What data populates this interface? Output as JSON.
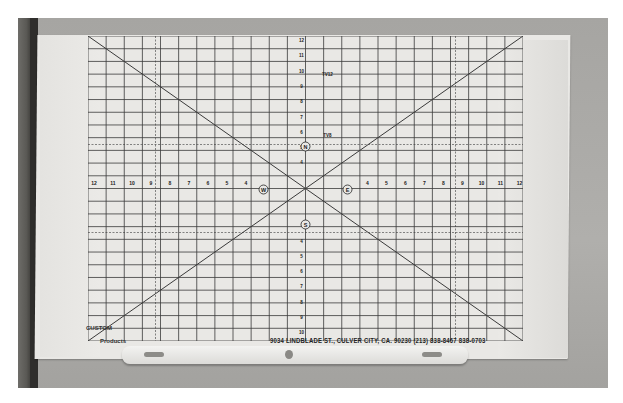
{
  "photo": {
    "subject": "TV camera alignment grid chart",
    "colors": {
      "board": "#e9e8e5",
      "grid_line": "#3a3a3a",
      "background_wall": "#a9a9a7",
      "wood_edge": "#3a3936"
    }
  },
  "chart": {
    "horizontal_scale_left": [
      "12",
      "11",
      "10",
      "9",
      "8",
      "7",
      "6",
      "5",
      "4"
    ],
    "horizontal_scale_right": [
      "4",
      "5",
      "6",
      "7",
      "8",
      "9",
      "10",
      "11",
      "12"
    ],
    "vertical_scale_top": [
      "12",
      "11",
      "10",
      "9",
      "8",
      "7",
      "6",
      "5",
      "4"
    ],
    "vertical_scale_bottom": [
      "4",
      "5",
      "6",
      "7",
      "8",
      "9",
      "10",
      "11",
      "12"
    ],
    "compass": {
      "north": "N",
      "south": "S",
      "east": "E",
      "west": "W"
    },
    "tv_marks": {
      "upper": "TV12",
      "lower": "TV8"
    }
  },
  "footer": {
    "address": "9034 LINDBLADE ST., CULVER CITY, CA. 90230 (213) 838-8467 838-0703",
    "logo_text": "CUSTOM",
    "logo_subtext": "Products"
  }
}
